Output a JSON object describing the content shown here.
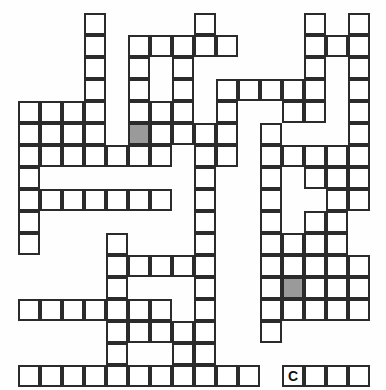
{
  "puzzle": {
    "type": "crossword-skeleton-grid",
    "title": "Crossword Puzzle Grid",
    "columns": 16,
    "rows": 17,
    "cell_size": 22,
    "origin_x": 18,
    "origin_y": 13,
    "colors": {
      "background": "#fefefe",
      "cell_fill": "#ffffff",
      "cell_border": "#2b2b2b",
      "shaded_fill": "#9a9a9a",
      "letter_color": "#111111"
    },
    "border_width": 2,
    "letters": [
      {
        "row": 16,
        "col": 12,
        "text": "C"
      }
    ],
    "shaded_cells": [
      {
        "row": 5,
        "col": 5
      },
      {
        "row": 12,
        "col": 12
      }
    ],
    "grid": [
      [
        0,
        0,
        0,
        1,
        0,
        0,
        0,
        0,
        1,
        0,
        0,
        0,
        0,
        1,
        0,
        1
      ],
      [
        0,
        0,
        0,
        1,
        0,
        1,
        1,
        1,
        1,
        1,
        0,
        0,
        0,
        1,
        1,
        1
      ],
      [
        0,
        0,
        0,
        1,
        0,
        1,
        0,
        1,
        0,
        0,
        0,
        0,
        0,
        1,
        0,
        1
      ],
      [
        0,
        0,
        0,
        1,
        0,
        1,
        0,
        1,
        0,
        1,
        1,
        1,
        1,
        1,
        0,
        1
      ],
      [
        1,
        1,
        1,
        1,
        0,
        1,
        1,
        1,
        0,
        1,
        0,
        0,
        1,
        1,
        0,
        1
      ],
      [
        1,
        1,
        1,
        1,
        0,
        1,
        1,
        1,
        1,
        1,
        0,
        1,
        0,
        0,
        0,
        1
      ],
      [
        1,
        1,
        1,
        1,
        1,
        1,
        1,
        0,
        1,
        1,
        0,
        1,
        1,
        1,
        1,
        1
      ],
      [
        1,
        0,
        0,
        0,
        0,
        0,
        0,
        0,
        1,
        0,
        0,
        1,
        0,
        1,
        1,
        1
      ],
      [
        1,
        1,
        1,
        1,
        1,
        1,
        1,
        0,
        1,
        0,
        0,
        1,
        0,
        0,
        1,
        1
      ],
      [
        1,
        0,
        0,
        0,
        0,
        0,
        0,
        0,
        1,
        0,
        0,
        1,
        0,
        1,
        1,
        0
      ],
      [
        1,
        0,
        0,
        0,
        1,
        0,
        0,
        0,
        1,
        0,
        0,
        1,
        1,
        1,
        1,
        0
      ],
      [
        0,
        0,
        0,
        0,
        1,
        1,
        1,
        1,
        1,
        0,
        0,
        1,
        1,
        1,
        1,
        1
      ],
      [
        0,
        0,
        0,
        0,
        1,
        0,
        0,
        0,
        1,
        0,
        0,
        1,
        1,
        1,
        1,
        1
      ],
      [
        1,
        1,
        1,
        1,
        1,
        1,
        1,
        0,
        1,
        0,
        0,
        1,
        1,
        1,
        1,
        1
      ],
      [
        0,
        0,
        0,
        0,
        1,
        1,
        1,
        1,
        1,
        0,
        0,
        1,
        0,
        0,
        0,
        0
      ],
      [
        0,
        0,
        0,
        0,
        1,
        0,
        0,
        1,
        1,
        0,
        0,
        0,
        0,
        0,
        0,
        0
      ],
      [
        1,
        1,
        1,
        1,
        1,
        1,
        1,
        1,
        1,
        1,
        1,
        0,
        1,
        1,
        1,
        1
      ]
    ]
  }
}
